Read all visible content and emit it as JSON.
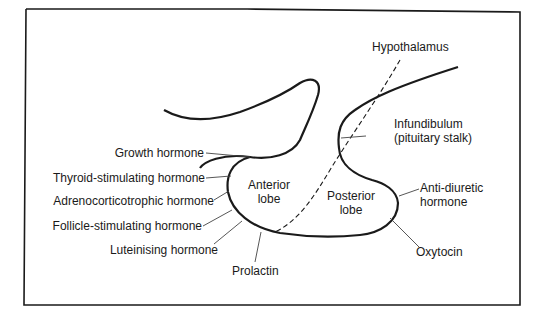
{
  "diagram": {
    "labels": {
      "hypothalamus": "Hypothalamus",
      "infundibulum_line1": "Infundibulum",
      "infundibulum_line2": "(pituitary stalk)",
      "anterior_lobe_line1": "Anterior",
      "anterior_lobe_line2": "lobe",
      "posterior_lobe_line1": "Posterior",
      "posterior_lobe_line2": "lobe"
    },
    "anterior_hormones": [
      {
        "label": "Growth hormone"
      },
      {
        "label": "Thyroid-stimulating hormone"
      },
      {
        "label": "Adrenocorticotrophic hormone"
      },
      {
        "label": "Follicle-stimulating hormone"
      },
      {
        "label": "Luteinising hormone"
      },
      {
        "label": "Prolactin"
      }
    ],
    "posterior_hormones": [
      {
        "label_line1": "Anti-diuretic",
        "label_line2": "hormone"
      },
      {
        "label": "Oxytocin"
      }
    ],
    "colors": {
      "stroke": "#1a1a1a",
      "leader": "#444444",
      "background": "#ffffff"
    }
  }
}
